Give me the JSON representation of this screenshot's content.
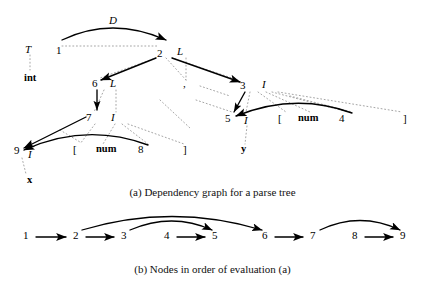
{
  "figure": {
    "ink_color": "#000000",
    "dotted_edge_color": "#9a9a9a"
  },
  "panel_a": {
    "caption": "(a) Dependency graph for a parse tree",
    "nodes": [
      {
        "id": "a-node-1",
        "label": "1",
        "x": 60,
        "y": 51
      },
      {
        "id": "a-node-2",
        "label": "2",
        "x": 160,
        "y": 54
      },
      {
        "id": "a-node-3",
        "label": "3",
        "x": 243,
        "y": 86
      },
      {
        "id": "a-node-4",
        "label": "4",
        "x": 342,
        "y": 119
      },
      {
        "id": "a-node-5",
        "label": "5",
        "x": 228,
        "y": 119
      },
      {
        "id": "a-node-6",
        "label": "6",
        "x": 95,
        "y": 84
      },
      {
        "id": "a-node-7",
        "label": "7",
        "x": 89,
        "y": 118
      },
      {
        "id": "a-node-8",
        "label": "8",
        "x": 141,
        "y": 150
      },
      {
        "id": "a-node-9",
        "label": "9",
        "x": 17,
        "y": 151
      }
    ],
    "attributes": [
      {
        "id": "a-attr-T",
        "label": "T",
        "x": 28,
        "y": 50
      },
      {
        "id": "a-attr-D",
        "label": "D",
        "x": 112,
        "y": 22
      },
      {
        "id": "a-attr-L2",
        "label": "L",
        "x": 180,
        "y": 52
      },
      {
        "id": "a-attr-L6",
        "label": "L",
        "x": 113,
        "y": 84
      },
      {
        "id": "a-attr-I3",
        "label": "I",
        "x": 264,
        "y": 85
      },
      {
        "id": "a-attr-I5",
        "label": "I",
        "x": 246,
        "y": 121
      },
      {
        "id": "a-attr-I7",
        "label": "I",
        "x": 113,
        "y": 118
      },
      {
        "id": "a-attr-I9",
        "label": "I",
        "x": 31,
        "y": 155
      }
    ],
    "terminals": [
      {
        "id": "a-term-int",
        "label": "int",
        "x": 27,
        "y": 79
      },
      {
        "id": "a-term-comma",
        "label": ",",
        "x": 184,
        "y": 84
      },
      {
        "id": "a-term-x",
        "label": "x",
        "x": 29,
        "y": 181
      },
      {
        "id": "a-term-y",
        "label": "y",
        "x": 243,
        "y": 150
      },
      {
        "id": "a-term-num-8",
        "label": "num",
        "x": 100,
        "y": 150
      },
      {
        "id": "a-term-num-4",
        "label": "num",
        "x": 302,
        "y": 119
      }
    ],
    "punctuation": [
      {
        "id": "a-bracket-open-8",
        "label": "[",
        "x": 74,
        "y": 150
      },
      {
        "id": "a-bracket-close-8",
        "label": "]",
        "x": 184,
        "y": 150
      },
      {
        "id": "a-bracket-open-4",
        "label": "[",
        "x": 279,
        "y": 119
      },
      {
        "id": "a-bracket-close-4",
        "label": "]",
        "x": 404,
        "y": 119
      }
    ]
  },
  "panel_b": {
    "caption": "(b) Nodes in order of evaluation (a)",
    "nodes": [
      {
        "id": "b-node-1",
        "label": "1",
        "x": 26,
        "y": 236
      },
      {
        "id": "b-node-2",
        "label": "2",
        "x": 76,
        "y": 236
      },
      {
        "id": "b-node-3",
        "label": "3",
        "x": 124,
        "y": 236
      },
      {
        "id": "b-node-4",
        "label": "4",
        "x": 167,
        "y": 236
      },
      {
        "id": "b-node-5",
        "label": "5",
        "x": 215,
        "y": 236
      },
      {
        "id": "b-node-6",
        "label": "6",
        "x": 265,
        "y": 236
      },
      {
        "id": "b-node-7",
        "label": "7",
        "x": 313,
        "y": 236
      },
      {
        "id": "b-node-8",
        "label": "8",
        "x": 355,
        "y": 236
      },
      {
        "id": "b-node-9",
        "label": "9",
        "x": 403,
        "y": 236
      }
    ],
    "straight_edges": [
      "1-2",
      "2-3",
      "4-5",
      "6-7",
      "8-9"
    ],
    "arc_edges": [
      "2-6",
      "3-5",
      "7-9"
    ]
  }
}
